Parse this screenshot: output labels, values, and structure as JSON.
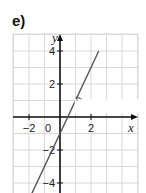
{
  "part_label": "e)",
  "chart_data": {
    "type": "line",
    "title": "",
    "xlabel": "x",
    "ylabel": "y",
    "function_label": "f(x) = 2x − 1",
    "series": [
      {
        "name": "f(x) = 2x − 1",
        "x": [
          -2.0,
          2.5
        ],
        "y": [
          -5,
          4
        ]
      }
    ],
    "x_ticks": [
      {
        "value": -2,
        "label": "−2"
      },
      {
        "value": 0,
        "label": "0"
      },
      {
        "value": 2,
        "label": "2"
      }
    ],
    "y_ticks": [
      {
        "value": 4,
        "label": "4"
      },
      {
        "value": 2,
        "label": "2"
      },
      {
        "value": -2,
        "label": "−2"
      },
      {
        "value": -4,
        "label": "−4"
      }
    ],
    "xlim": [
      -3,
      5
    ],
    "ylim": [
      -5,
      5
    ],
    "grid": true,
    "colors": {
      "line": "#555555",
      "grid": "#d8d8d8",
      "axis": "#111111"
    }
  }
}
